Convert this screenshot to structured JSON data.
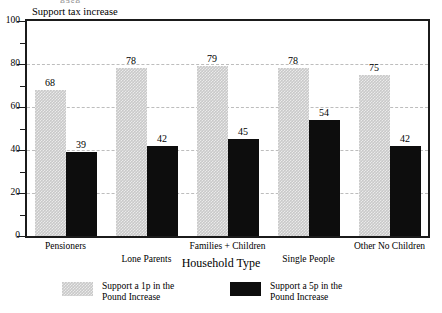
{
  "top_clipped_text": "ease",
  "chart_data": {
    "type": "bar",
    "title": "",
    "ylabel": "Support tax increase",
    "xlabel": "Household Type",
    "ylim": [
      0,
      100
    ],
    "y_ticks": [
      0,
      20,
      40,
      60,
      80,
      100
    ],
    "y_tick_labels": [
      "0",
      "20",
      "40",
      "60",
      "80",
      "100"
    ],
    "y_minor_ticks": [
      10,
      30,
      50,
      70,
      90
    ],
    "grid": "horizontal-dashed",
    "legend_position": "bottom",
    "categories": [
      "Pensioners",
      "Lone Parents",
      "Families + Children",
      "Single People",
      "Other No Children"
    ],
    "series": [
      {
        "name": "Support a 1p in the Pound Increase",
        "color": "#c9c9c9",
        "values": [
          68,
          78,
          79,
          78,
          75
        ]
      },
      {
        "name": "Support a 5p in the Pound Increase",
        "color": "#0d0d0d",
        "values": [
          39,
          42,
          45,
          54,
          42
        ]
      }
    ]
  },
  "legend": {
    "items": [
      {
        "label_line1": "Support a 1p in the",
        "label_line2": "Pound Increase",
        "swatch": "light"
      },
      {
        "label_line1": "Support a 5p in the",
        "label_line2": "Pound Increase",
        "swatch": "dark"
      }
    ]
  }
}
